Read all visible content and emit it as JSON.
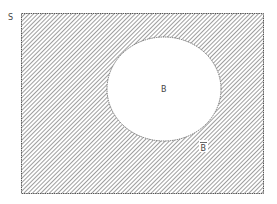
{
  "diagram": {
    "type": "venn",
    "universe_label": "S",
    "set_label": "B",
    "complement_label": "B̄",
    "complement_base": "B",
    "shaded_region": "complement of B",
    "colors": {
      "hatch": "#6a6a6a",
      "border": "#555555",
      "background": "#ffffff",
      "text": "#444444"
    }
  }
}
